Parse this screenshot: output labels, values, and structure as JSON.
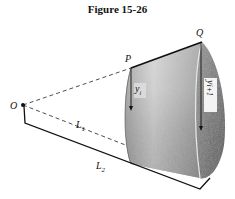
{
  "figure": {
    "title": "Figure 15-26",
    "labels": {
      "origin": "O",
      "point_p": "P",
      "point_q": "Q",
      "height_left": "y",
      "height_left_sub": "i",
      "height_right": "y",
      "height_right_sub": "i+1",
      "length_1": "L",
      "length_1_sub": "1",
      "length_2": "L",
      "length_2_sub": "2"
    },
    "colors": {
      "ink": "#111111",
      "surface_light": "#d8d8d8",
      "surface_dark": "#5a5a5a",
      "background": "#ffffff"
    }
  }
}
